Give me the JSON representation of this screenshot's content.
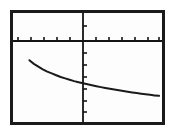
{
  "window": {
    "title": "Graphing calculator plot",
    "background_color": "#ffffff"
  },
  "frame": {
    "border_color": "#1a1a1a",
    "border_width_px": 3,
    "fill_color": "#fdfdfd",
    "left_px": 10,
    "top_px": 10,
    "width_px": 155,
    "height_px": 115
  },
  "axes": {
    "axis_color": "#141414",
    "x_axis": {
      "label": "",
      "screen_y_px": 28,
      "tick_count": 11,
      "tick_direction": "up",
      "tick_length_px": 4
    },
    "y_axis": {
      "label": "",
      "screen_x_px": 70,
      "tick_count": 8,
      "tick_direction": "right",
      "tick_length_px": 4
    }
  },
  "chart_data": {
    "type": "line",
    "title": "",
    "subtitle": "",
    "xlabel": "",
    "ylabel": "",
    "grid": false,
    "legend": null,
    "axis_style": "calculator-ticks",
    "curve_color": "#1a1a1a",
    "curve_width_px": 2,
    "xlim": [
      -10,
      10
    ],
    "ylim": [
      -10,
      2
    ],
    "x": [
      -7.8,
      -7.2,
      -6.6,
      -6.0,
      -5.4,
      -4.8,
      -4.2,
      -3.6,
      -3.0,
      -2.4,
      -1.8,
      -1.2,
      -0.6,
      0.0,
      0.6,
      1.2,
      1.8,
      2.4,
      3.0,
      3.6,
      4.2,
      4.8,
      5.4,
      6.0,
      6.6,
      7.2,
      7.8,
      8.4,
      9.0,
      9.6
    ],
    "y": [
      -3.2,
      -3.6,
      -3.9,
      -4.2,
      -4.45,
      -4.65,
      -4.85,
      -5.05,
      -5.2,
      -5.35,
      -5.5,
      -5.62,
      -5.74,
      -5.85,
      -5.96,
      -6.06,
      -6.16,
      -6.25,
      -6.34,
      -6.43,
      -6.51,
      -6.59,
      -6.67,
      -6.74,
      -6.81,
      -6.88,
      -6.95,
      -7.01,
      -7.07,
      -7.12
    ],
    "series": [
      {
        "name": "y = f(x)",
        "values": [
          -3.2,
          -3.6,
          -3.9,
          -4.2,
          -4.45,
          -4.65,
          -4.85,
          -5.05,
          -5.2,
          -5.35,
          -5.5,
          -5.62,
          -5.74,
          -5.85,
          -5.96,
          -6.06,
          -6.16,
          -6.25,
          -6.34,
          -6.43,
          -6.51,
          -6.59,
          -6.67,
          -6.74,
          -6.81,
          -6.88,
          -6.95,
          -7.01,
          -7.07,
          -7.12
        ]
      }
    ],
    "x_tick_values": [
      -9,
      -7.2,
      -5.4,
      -3.6,
      -1.8,
      0,
      1.8,
      3.6,
      5.4,
      7.2,
      9
    ],
    "y_tick_values": [
      1.2,
      -1.2,
      -2.4,
      -3.6,
      -4.8,
      -6.0,
      -7.2,
      -8.4
    ],
    "xtick_labels": [],
    "ytick_labels": []
  }
}
